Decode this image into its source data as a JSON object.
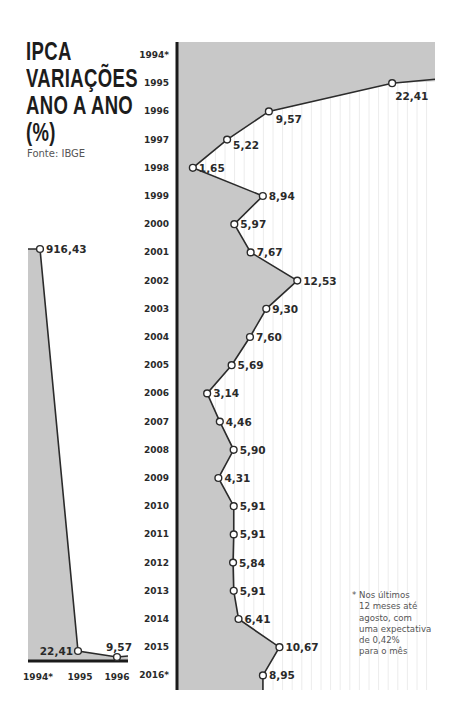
{
  "title_lines": [
    "IPCA",
    "VARIAÇÕES",
    "ANO A ANO",
    "(%)"
  ],
  "source": "Fonte: IBGE",
  "note_lines": [
    "* Nos últimos",
    "12 meses até",
    "agosto, com",
    "uma expectativa",
    "de 0,42%",
    "para o mês"
  ],
  "colors": {
    "fill": "#c8c8c8",
    "line": "#2b2b2b",
    "axis": "#1a1a1a",
    "grid": "#ececec"
  },
  "chart_data": [
    {
      "type": "area",
      "title": "IPCA variações ano a ano (%) — 1994 a 1996",
      "orientation": "vertical",
      "categories": [
        "1994*",
        "1995",
        "1996"
      ],
      "values": [
        916.43,
        22.41,
        9.57
      ],
      "labels": [
        "916,43",
        "22,41",
        "9,57"
      ],
      "ylim": [
        0,
        950
      ]
    },
    {
      "type": "area",
      "title": "IPCA variações ano a ano (%) — 1994 a 2016",
      "orientation": "horizontal",
      "categories": [
        "1994*",
        "1995",
        "1996",
        "1997",
        "1998",
        "1999",
        "2000",
        "2001",
        "2002",
        "2003",
        "2004",
        "2005",
        "2006",
        "2007",
        "2008",
        "2009",
        "2010",
        "2011",
        "2012",
        "2013",
        "2014",
        "2015",
        "2016*"
      ],
      "values": [
        916.43,
        22.41,
        9.57,
        5.22,
        1.65,
        8.94,
        5.97,
        7.67,
        12.53,
        9.3,
        7.6,
        5.69,
        3.14,
        4.46,
        5.9,
        4.31,
        5.91,
        5.91,
        5.84,
        5.91,
        6.41,
        10.67,
        8.95
      ],
      "labels": [
        "",
        "22,41",
        "9,57",
        "5,22",
        "1,65",
        "8,94",
        "5,97",
        "7,67",
        "12,53",
        "9,30",
        "7,60",
        "5,69",
        "3,14",
        "4,46",
        "5,90",
        "4,31",
        "5,91",
        "5,91",
        "5,84",
        "5,91",
        "6,41",
        "10,67",
        "8,95"
      ],
      "xlim": [
        0,
        27
      ],
      "grid": true
    }
  ]
}
